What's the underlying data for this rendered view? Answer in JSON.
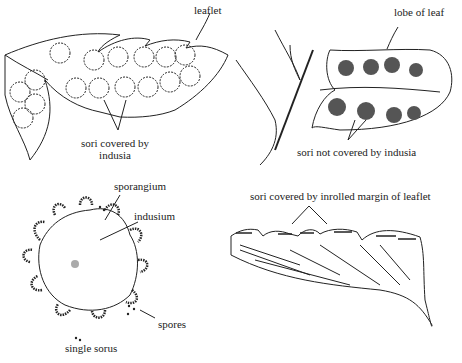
{
  "panels": [
    {
      "id": "top-left",
      "subject": "leaflet with indusia",
      "labels": {
        "leaflet": "leaflet",
        "sori": "sori covered by",
        "sori_line2": "indusia"
      }
    },
    {
      "id": "top-right",
      "subject": "lobe of leaf without indusia",
      "labels": {
        "lobe": "lobe of leaf",
        "sori": "sori not covered by indusia"
      }
    },
    {
      "id": "bottom-left",
      "subject": "single sorus",
      "labels": {
        "sporangium": "sporangium",
        "indusium": "indusium",
        "spores": "spores",
        "caption": "single sorus"
      }
    },
    {
      "id": "bottom-right",
      "subject": "inrolled margin",
      "labels": {
        "sori": "sori covered by inrolled margin of leaflet"
      }
    }
  ],
  "colors": {
    "ink": "#222222",
    "background": "#ffffff"
  }
}
